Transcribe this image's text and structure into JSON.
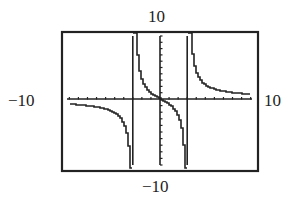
{
  "window_labels": {
    "ymax": "10",
    "ymin": "−10",
    "xmin": "−10",
    "xmax": "10"
  },
  "chart_data": {
    "type": "line",
    "title": "",
    "xlabel": "",
    "ylabel": "",
    "xlim": [
      -10,
      10
    ],
    "ylim": [
      -10,
      10
    ],
    "x_ticks_step": 1,
    "y_ticks_step": 1,
    "grid": false,
    "vertical_asymptotes": [
      -3,
      3
    ],
    "series": [
      {
        "name": "f(x) = x/(x^2-9) (approx)",
        "x": [
          -10,
          -8,
          -6,
          -5,
          -4,
          -3.5,
          -3.2,
          -2.8,
          -2.5,
          -2,
          -1,
          0,
          1,
          2,
          2.5,
          2.8,
          3.2,
          3.5,
          4,
          5,
          6,
          8,
          10
        ],
        "y": [
          -1.1,
          -1.3,
          -2,
          -2.3,
          -3.8,
          -7,
          -10,
          10,
          7,
          3.5,
          1.2,
          0,
          -1.2,
          -3.5,
          -7,
          -10,
          10,
          7,
          3.8,
          2.3,
          2,
          1.3,
          1.1
        ]
      }
    ]
  }
}
